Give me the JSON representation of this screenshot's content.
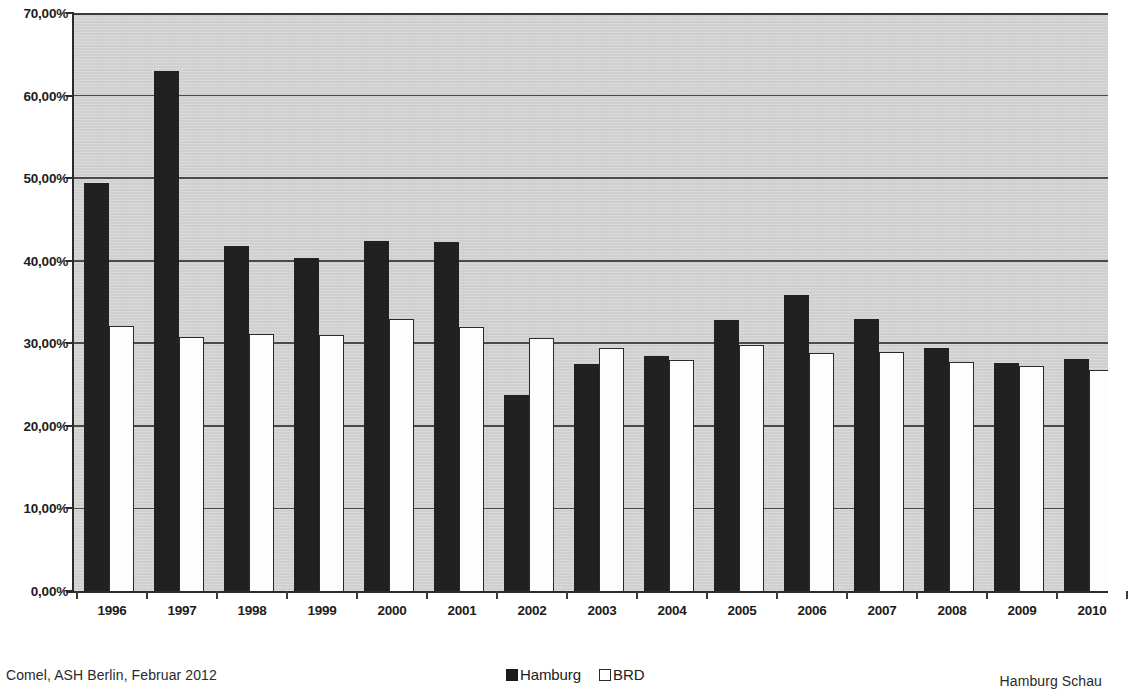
{
  "chart_data": {
    "type": "bar",
    "title": "",
    "xlabel": "",
    "ylabel": "",
    "ylim": [
      0,
      70
    ],
    "grid": true,
    "legend_position": "bottom-center",
    "y_tick_labels": [
      "70,00%",
      "60,00%",
      "50,00%",
      "40,00%",
      "30,00%",
      "20,00%",
      "10,00%",
      "0,00%"
    ],
    "y_tick_values": [
      70,
      60,
      50,
      40,
      30,
      20,
      10,
      0
    ],
    "categories": [
      "1996",
      "1997",
      "1998",
      "1999",
      "2000",
      "2001",
      "2002",
      "2003",
      "2004",
      "2005",
      "2006",
      "2007",
      "2008",
      "2009",
      "2010"
    ],
    "series": [
      {
        "name": "Hamburg",
        "color": "#1b1b1b",
        "style": "filled",
        "values": [
          49.4,
          63.0,
          41.8,
          40.3,
          42.4,
          42.3,
          23.7,
          27.5,
          28.5,
          32.8,
          35.9,
          33.0,
          29.4,
          27.6,
          28.1
        ]
      },
      {
        "name": "BRD",
        "color": "#ffffff",
        "style": "hollow",
        "values": [
          32.1,
          30.8,
          31.1,
          31.0,
          33.0,
          32.0,
          30.7,
          29.4,
          28.0,
          29.8,
          28.8,
          29.0,
          27.7,
          27.2,
          26.8
        ]
      }
    ],
    "note": "Chart is cropped at the right edge; the 2010 BRD bar is clipped by the image border."
  },
  "legend": {
    "items": [
      {
        "label": "Hamburg",
        "swatch": "filled-square-icon"
      },
      {
        "label": "BRD",
        "swatch": "hollow-square-icon"
      }
    ]
  },
  "footer": {
    "left": "Comel, ASH Berlin, Februar 2012",
    "right": "Hamburg Schau"
  }
}
